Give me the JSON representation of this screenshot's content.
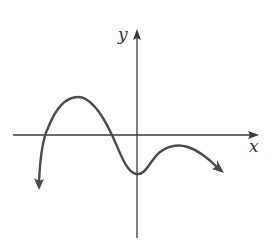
{
  "graph": {
    "x_axis_label": "x",
    "y_axis_label": "y",
    "curve_description": "Polynomial-like curve: comes up from bottom-left, crosses x-axis, reaches a local maximum above the axis, crosses back down left of the y-axis, hits a local minimum just right of the y-axis below the x-axis, rises to a smaller local maximum below the x-axis, then falls to the lower right",
    "colors": {
      "axis": "#3a3a3a",
      "curve": "#4a4a4a",
      "background": "#ffffff"
    },
    "features": {
      "left_end_behavior": "down",
      "right_end_behavior": "down",
      "x_intercepts_count": 2,
      "local_maxima_count": 2,
      "local_minima_count": 1,
      "y_intercept_sign": "negative"
    }
  }
}
